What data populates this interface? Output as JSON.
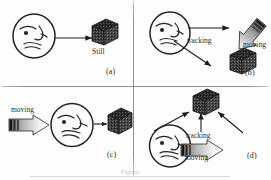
{
  "figure": {
    "type": "diagram",
    "title_visible": false,
    "bottom_caption": "Figure",
    "layout": "2x2 grid of panels separated by thin rules",
    "background_color": "#fdfdfd",
    "ink_color": "#222222",
    "divider_color": "#8d8d8d"
  },
  "panels": [
    {
      "id": "a",
      "label": "(a)",
      "observer": {
        "name": "face",
        "state": "still",
        "facing": "right"
      },
      "object": {
        "name": "cube",
        "label": "Still",
        "state": "still"
      },
      "arrows": [
        {
          "name": "gaze-arrow",
          "from": "face",
          "to": "cube",
          "direction": "right",
          "style": "thin-line",
          "label": ""
        }
      ],
      "labels": [
        "Still"
      ]
    },
    {
      "id": "b",
      "label": "(b)",
      "observer": {
        "name": "face",
        "state": "tracking",
        "facing": "right"
      },
      "object": {
        "name": "cube",
        "label": "",
        "state": "still"
      },
      "arrows": [
        {
          "name": "tracking-arrow-upper",
          "direction": "right",
          "style": "thin-line",
          "label": "tracking"
        },
        {
          "name": "tracking-arrow-lower",
          "direction": "down-right",
          "style": "thin-line",
          "label": ""
        },
        {
          "name": "motion-arrow",
          "direction": "down-left",
          "style": "gradient-block",
          "label": "moving"
        }
      ],
      "labels": [
        "tracking",
        "moving"
      ]
    },
    {
      "id": "c",
      "label": "(c)",
      "observer": {
        "name": "face",
        "state": "moving",
        "facing": "right"
      },
      "object": {
        "name": "cube",
        "label": "",
        "state": "still"
      },
      "arrows": [
        {
          "name": "motion-arrow",
          "direction": "right",
          "style": "gradient-block",
          "label": "moving"
        },
        {
          "name": "gaze-arrow",
          "direction": "right",
          "style": "thin-line",
          "label": ""
        }
      ],
      "labels": [
        "moving"
      ]
    },
    {
      "id": "d",
      "label": "(d)",
      "observer": {
        "name": "face",
        "state": "moving-and-tracking",
        "facing": "right"
      },
      "object": {
        "name": "cube",
        "label": "",
        "state": "still"
      },
      "arrows": [
        {
          "name": "tracking-arrow-left",
          "direction": "up-right",
          "style": "thin-line",
          "label": ""
        },
        {
          "name": "tracking-arrow-center",
          "direction": "up",
          "style": "thin-line",
          "label": "tracking"
        },
        {
          "name": "tracking-arrow-right",
          "direction": "up-left",
          "style": "thin-line",
          "label": ""
        },
        {
          "name": "motion-arrow",
          "direction": "right",
          "style": "gradient-block",
          "label": "moving"
        }
      ],
      "labels": [
        "tracking",
        "moving"
      ]
    }
  ]
}
